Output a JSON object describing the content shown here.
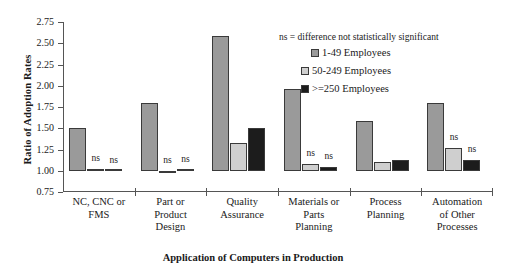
{
  "chart_data": {
    "type": "bar",
    "title": "",
    "xlabel": "Application of Computers in Production",
    "ylabel": "Ratio of Adoption Rates",
    "ylim": [
      0.75,
      2.75
    ],
    "ytick_labels": [
      "2.75",
      "2.50",
      "2.25",
      "2.00",
      "1.75",
      "1.50",
      "1.25",
      "1.00",
      "0.75"
    ],
    "ytick_values": [
      2.75,
      2.5,
      2.25,
      2.0,
      1.75,
      1.5,
      1.25,
      1.0,
      0.75
    ],
    "grid": false,
    "legend_position": "upper-right-inside",
    "baseline": 1.0,
    "categories": [
      "NC, CNC or FMS",
      "Part or Product Design",
      "Quality Assurance",
      "Materials or Parts Planning",
      "Process Planning",
      "Automation of Other Processes"
    ],
    "category_lines": [
      [
        "NC, CNC or",
        "FMS"
      ],
      [
        "Part or",
        "Product",
        "Design"
      ],
      [
        "Quality",
        "Assurance"
      ],
      [
        "Materials or",
        "Parts",
        "Planning"
      ],
      [
        "Process",
        "Planning"
      ],
      [
        "Automation",
        "of Other",
        "Processes"
      ]
    ],
    "series": [
      {
        "name": "1-49 Employees",
        "color": "#9a9a9a",
        "values": [
          1.5,
          1.8,
          2.59,
          1.96,
          1.58,
          1.8
        ],
        "ns_flags": [
          false,
          false,
          false,
          false,
          false,
          false
        ]
      },
      {
        "name": "50-249 Employees",
        "color": "#cfcfcf",
        "values": [
          1.02,
          0.97,
          1.33,
          1.08,
          1.1,
          1.27
        ],
        "ns_flags": [
          true,
          true,
          false,
          true,
          false,
          true
        ]
      },
      {
        "name": ">=250 Employees",
        "color": "#1c1c1c",
        "values": [
          1.0,
          1.01,
          1.5,
          1.04,
          1.13,
          1.13
        ],
        "ns_flags": [
          true,
          true,
          false,
          true,
          false,
          true
        ]
      }
    ],
    "annotations": {
      "ns_text": "ns",
      "ns_note": "ns = difference not statistically significant"
    }
  },
  "legend": {
    "note": "ns = difference not statistically significant",
    "entries": [
      {
        "label": "1-49 Employees",
        "color": "#9a9a9a"
      },
      {
        "label": "50-249 Employees",
        "color": "#cfcfcf"
      },
      {
        "label": ">=250 Employees",
        "color": "#1c1c1c"
      }
    ]
  }
}
